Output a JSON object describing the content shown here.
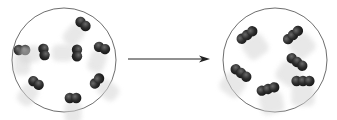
{
  "diagram": {
    "colors": {
      "background": "#ffffff",
      "circle_stroke": "#6e6e6e",
      "atom_fill": "#2b2b2b",
      "atom_highlight": "#555555",
      "motion_blur": "#d6d6d6",
      "arrow": "#222222"
    },
    "left_container": {
      "label": "",
      "cx": 64,
      "cy": 60,
      "r": 52,
      "molecules": [
        {
          "type": "diatomic",
          "x": 83,
          "y": 24,
          "angle": 40
        },
        {
          "type": "diatomic",
          "x": 22,
          "y": 50,
          "angle": 0
        },
        {
          "type": "diatomic",
          "x": 44,
          "y": 52,
          "angle": 80
        },
        {
          "type": "diatomic",
          "x": 77,
          "y": 53,
          "angle": 90
        },
        {
          "type": "diatomic",
          "x": 102,
          "y": 48,
          "angle": 20
        },
        {
          "type": "diatomic",
          "x": 36,
          "y": 83,
          "angle": 35
        },
        {
          "type": "diatomic",
          "x": 97,
          "y": 81,
          "angle": -50
        },
        {
          "type": "diatomic",
          "x": 73,
          "y": 98,
          "angle": 0
        }
      ]
    },
    "arrow": {
      "x1": 128,
      "y1": 59,
      "x2": 210,
      "y2": 59
    },
    "right_container": {
      "label": "",
      "cx": 275,
      "cy": 60,
      "r": 52,
      "molecules": [
        {
          "type": "triatomic",
          "x": 247,
          "y": 35,
          "angle": -35
        },
        {
          "type": "triatomic",
          "x": 293,
          "y": 35,
          "angle": -40
        },
        {
          "type": "triatomic",
          "x": 241,
          "y": 73,
          "angle": 35
        },
        {
          "type": "triatomic",
          "x": 297,
          "y": 62,
          "angle": 35
        },
        {
          "type": "triatomic",
          "x": 268,
          "y": 89,
          "angle": -15
        },
        {
          "type": "triatomic",
          "x": 303,
          "y": 81,
          "angle": 0
        }
      ]
    }
  }
}
